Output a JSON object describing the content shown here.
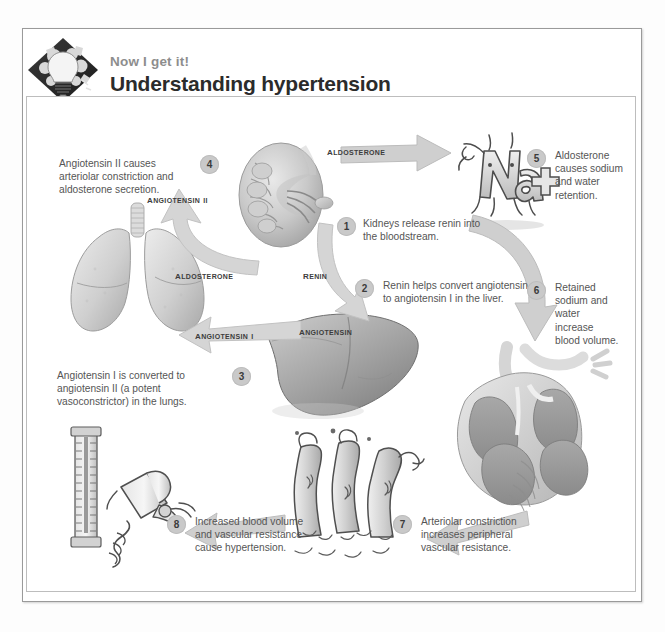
{
  "header": {
    "logo_icon": "lightbulb-gear-diamond-logo",
    "kicker": "Now I get it!",
    "title": "Understanding hypertension"
  },
  "diagram": {
    "name": "renin-angiotensin-aldosterone-hypertension-cycle",
    "steps": [
      {
        "number": "1",
        "text": "Kidneys release renin into the bloodstream."
      },
      {
        "number": "2",
        "text": "Renin helps convert angiotensin to angiotensin I in the liver."
      },
      {
        "number": "3",
        "text": "Angiotensin I is converted to angiotensin II (a potent vasoconstrictor) in the lungs."
      },
      {
        "number": "4",
        "text": "Angiotensin II causes arteriolar constriction and aldosterone secretion."
      },
      {
        "number": "5",
        "text": "Aldosterone causes sodium and water retention."
      },
      {
        "number": "6",
        "text": "Retained sodium and water increase blood volume."
      },
      {
        "number": "7",
        "text": "Arteriolar constriction increases peripheral vascular resistance."
      },
      {
        "number": "8",
        "text": "Increased blood volume and vascular resistance cause hypertension."
      }
    ],
    "labels": {
      "aldosterone_top": "Aldosterone",
      "aldosterone_left": "Aldosterone",
      "renin": "Renin",
      "angiotensin": "Angiotensin",
      "angiotensin_i": "Angiotensin I",
      "angiotensin_ii": "Angiotensin II",
      "sodium_character": "Na+"
    },
    "illustrations": [
      {
        "name": "kidney-illustration",
        "caption": "kidney cross section"
      },
      {
        "name": "sodium-cartoon-illustration",
        "caption": "Na+ cartoon character"
      },
      {
        "name": "heart-illustration",
        "caption": "heart cross section"
      },
      {
        "name": "lungs-illustration",
        "caption": "lungs"
      },
      {
        "name": "liver-illustration",
        "caption": "liver"
      },
      {
        "name": "arterioles-illustration",
        "caption": "constricted arterioles"
      },
      {
        "name": "sphygmomanometer-illustration",
        "caption": "blood pressure cuff and manometer"
      }
    ]
  },
  "colors": {
    "text": "#555555",
    "title": "#2b2b2b",
    "kicker": "#8d8d8d",
    "step_badge": "#c9c9c9",
    "arrow": "#cfcfcf",
    "frame": "#9a9a9a",
    "organ_light": "#d6d6d6",
    "organ_mid": "#b4b4b4",
    "organ_dark": "#8f8f8f"
  }
}
